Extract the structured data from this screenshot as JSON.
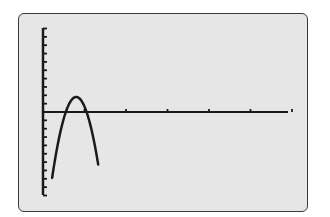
{
  "chart_data": {
    "type": "line",
    "title": "",
    "xlabel": "",
    "ylabel": "",
    "grid": false,
    "x_axis": {
      "tick_count_visible": 5,
      "tick_spacing_units": 1,
      "xlim": [
        0,
        6
      ]
    },
    "y_axis": {
      "ticks_above_axis": 10,
      "ticks_below_axis": 10,
      "ylim": [
        -10,
        10
      ]
    },
    "series": [
      {
        "name": "parabola",
        "equation_form": "y = -a(x - h)^2 + k",
        "vertex": [
          0.8,
          1.8
        ],
        "x_intercepts": [
          0.55,
          1.05
        ],
        "x": [
          0.22,
          0.4,
          0.55,
          0.7,
          0.8,
          0.9,
          1.05,
          1.2,
          1.33
        ],
        "y": [
          -10,
          -4.5,
          0,
          1.35,
          1.8,
          1.35,
          0,
          -4.5,
          -10
        ]
      }
    ],
    "colors": {
      "screen_background": "#e6e6e6",
      "curve": "#1a1a1a",
      "axes": "#1a1a1a",
      "frame": "#3a3a3a"
    }
  }
}
